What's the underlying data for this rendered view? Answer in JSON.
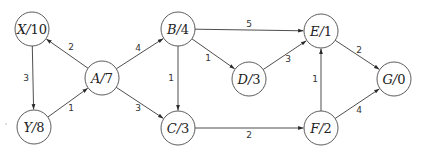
{
  "graph": {
    "type": "directed-weighted-graph",
    "node_radius": 17,
    "nodes": [
      {
        "id": "X",
        "name": "X",
        "heuristic": "10",
        "x": 32,
        "y": 29
      },
      {
        "id": "Y",
        "name": "Y",
        "heuristic": "8",
        "x": 34,
        "y": 127
      },
      {
        "id": "A",
        "name": "A",
        "heuristic": "7",
        "x": 102,
        "y": 78
      },
      {
        "id": "B",
        "name": "B",
        "heuristic": "4",
        "x": 178,
        "y": 29
      },
      {
        "id": "C",
        "name": "C",
        "heuristic": "3",
        "x": 178,
        "y": 128
      },
      {
        "id": "D",
        "name": "D",
        "heuristic": "3",
        "x": 249,
        "y": 79
      },
      {
        "id": "E",
        "name": "E",
        "heuristic": "1",
        "x": 321,
        "y": 31
      },
      {
        "id": "F",
        "name": "F",
        "heuristic": "2",
        "x": 321,
        "y": 128
      },
      {
        "id": "G",
        "name": "G",
        "heuristic": "0",
        "x": 394,
        "y": 79
      }
    ],
    "edges": [
      {
        "from": "A",
        "to": "X",
        "weight": "2",
        "label_x": 71,
        "label_y": 50
      },
      {
        "from": "X",
        "to": "Y",
        "weight": "3",
        "label_x": 26,
        "label_y": 81
      },
      {
        "from": "Y",
        "to": "A",
        "weight": "1",
        "label_x": 71,
        "label_y": 111
      },
      {
        "from": "A",
        "to": "B",
        "weight": "4",
        "label_x": 138,
        "label_y": 51
      },
      {
        "from": "A",
        "to": "C",
        "weight": "3",
        "label_x": 138,
        "label_y": 111
      },
      {
        "from": "B",
        "to": "C",
        "weight": "1",
        "label_x": 171,
        "label_y": 81
      },
      {
        "from": "B",
        "to": "D",
        "weight": "1",
        "label_x": 208,
        "label_y": 61
      },
      {
        "from": "B",
        "to": "E",
        "weight": "5",
        "label_x": 249,
        "label_y": 27
      },
      {
        "from": "D",
        "to": "E",
        "weight": "3",
        "label_x": 288,
        "label_y": 62
      },
      {
        "from": "C",
        "to": "F",
        "weight": "2",
        "label_x": 249,
        "label_y": 138
      },
      {
        "from": "F",
        "to": "E",
        "weight": "1",
        "label_x": 315,
        "label_y": 82
      },
      {
        "from": "E",
        "to": "G",
        "weight": "2",
        "label_x": 359,
        "label_y": 53
      },
      {
        "from": "F",
        "to": "G",
        "weight": "4",
        "label_x": 359,
        "label_y": 113
      }
    ],
    "line_color": "#3a3a3a",
    "node_stroke_color": "#4a4a4a"
  }
}
